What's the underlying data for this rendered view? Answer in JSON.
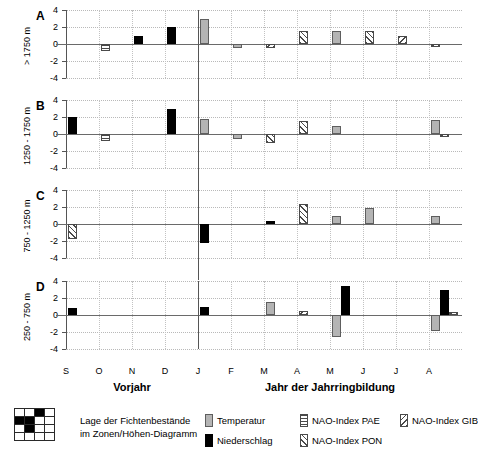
{
  "chart_data": {
    "type": "bar",
    "title": "",
    "xlabel": "",
    "ylabel": "",
    "ylim": [
      -4,
      4
    ],
    "yticks": [
      4,
      2,
      0,
      -2,
      -4
    ],
    "grid": true,
    "categories": [
      "S",
      "O",
      "N",
      "D",
      "J",
      "F",
      "M",
      "A",
      "M",
      "J",
      "J",
      "A"
    ],
    "group_labels": [
      "Vorjahr",
      "Jahr der Jahrringbildung"
    ],
    "group_split_after": "D",
    "series_keys": [
      "temperatur",
      "niederschlag",
      "pae",
      "pon",
      "gib"
    ],
    "panels": [
      {
        "letter": "A",
        "ylabel": "> 1750 m",
        "bars": [
          {
            "month": "O",
            "offset": 0,
            "value": -0.8,
            "series": "pae"
          },
          {
            "month": "N",
            "offset": 0,
            "value": 1.0,
            "series": "niederschlag"
          },
          {
            "month": "D",
            "offset": 0,
            "value": 2.0,
            "series": "niederschlag"
          },
          {
            "month": "F",
            "offset": 0,
            "value": -0.5,
            "series": "temperatur"
          },
          {
            "month": "M",
            "offset": 0,
            "value": -0.5,
            "series": "gib"
          },
          {
            "month": "A",
            "offset": 0,
            "value": 1.5,
            "series": "pon"
          },
          {
            "month": "M",
            "offset": 1,
            "value": 1.5,
            "series": "temperatur"
          },
          {
            "month": "J",
            "offset": 0,
            "value": 2.9,
            "series": "temperatur"
          },
          {
            "month": "J",
            "offset": 1,
            "value": 1.5,
            "series": "pon"
          },
          {
            "month": "J",
            "offset": 2,
            "value": 1.0,
            "series": "gib"
          },
          {
            "month": "A",
            "offset": 1,
            "value": -0.4,
            "series": "gib"
          }
        ]
      },
      {
        "letter": "B",
        "ylabel": "1250 - 1750 m",
        "bars": [
          {
            "month": "S",
            "offset": 0,
            "value": 2.0,
            "series": "niederschlag"
          },
          {
            "month": "O",
            "offset": 0,
            "value": -0.8,
            "series": "pae"
          },
          {
            "month": "D",
            "offset": 0,
            "value": 3.0,
            "series": "niederschlag"
          },
          {
            "month": "J",
            "offset": 0,
            "value": 1.0,
            "series": "niederschlag"
          },
          {
            "month": "F",
            "offset": 0,
            "value": -0.6,
            "series": "temperatur"
          },
          {
            "month": "M",
            "offset": 0,
            "value": -1.0,
            "series": "pon"
          },
          {
            "month": "A",
            "offset": 0,
            "value": 1.5,
            "series": "pon"
          },
          {
            "month": "A",
            "offset": 1,
            "value": 1.6,
            "series": "temperatur"
          },
          {
            "month": "M",
            "offset": 1,
            "value": 0.9,
            "series": "temperatur"
          },
          {
            "month": "J",
            "offset": 0,
            "value": 1.8,
            "series": "temperatur"
          },
          {
            "month": "A",
            "offset": 2,
            "value": -0.4,
            "series": "gib"
          }
        ]
      },
      {
        "letter": "C",
        "ylabel": "750 - 1250 m",
        "bars": [
          {
            "month": "S",
            "offset": 0,
            "value": -1.8,
            "series": "pon"
          },
          {
            "month": "J",
            "offset": 0,
            "value": -2.2,
            "series": "niederschlag"
          },
          {
            "month": "M",
            "offset": 0,
            "value": 0.4,
            "series": "niederschlag"
          },
          {
            "month": "A",
            "offset": 0,
            "value": 2.3,
            "series": "pon"
          },
          {
            "month": "A",
            "offset": 1,
            "value": 1.0,
            "series": "temperatur"
          },
          {
            "month": "M",
            "offset": 1,
            "value": 0.9,
            "series": "temperatur"
          },
          {
            "month": "J",
            "offset": 1,
            "value": 1.9,
            "series": "temperatur"
          }
        ]
      },
      {
        "letter": "D",
        "ylabel": "250 - 750 m",
        "bars": [
          {
            "month": "S",
            "offset": 0,
            "value": 0.8,
            "series": "niederschlag"
          },
          {
            "month": "M",
            "offset": 0,
            "value": 1.5,
            "series": "temperatur"
          },
          {
            "month": "A",
            "offset": 0,
            "value": 0.5,
            "series": "gib"
          },
          {
            "month": "A",
            "offset": 1,
            "value": -1.9,
            "series": "temperatur"
          },
          {
            "month": "A",
            "offset": 2,
            "value": 2.9,
            "series": "niederschlag"
          },
          {
            "month": "M",
            "offset": 1,
            "value": -2.6,
            "series": "temperatur"
          },
          {
            "month": "M",
            "offset": 2,
            "value": 3.4,
            "series": "niederschlag"
          },
          {
            "month": "J",
            "offset": 0,
            "value": 1.0,
            "series": "niederschlag"
          },
          {
            "month": "A",
            "offset": 3,
            "value": 0.4,
            "series": "gib"
          }
        ]
      }
    ],
    "legend": {
      "position": "bottom",
      "entries": [
        {
          "key": "map",
          "label_line1": "Lage der Fichtenbestände",
          "label_line2": "im Zonen/Höhen-Diagramm"
        },
        {
          "key": "temperatur",
          "label": "Temperatur"
        },
        {
          "key": "niederschlag",
          "label": "Niederschlag"
        },
        {
          "key": "pae",
          "label": "NAO-Index PAE"
        },
        {
          "key": "pon",
          "label": "NAO-Index PON"
        },
        {
          "key": "gib",
          "label": "NAO-Index GIB"
        }
      ],
      "map_icon": {
        "cols": 4,
        "rows": 4,
        "filled_cells": [
          [
            2,
            0
          ],
          [
            0,
            1
          ],
          [
            1,
            1
          ],
          [
            1,
            2
          ]
        ]
      }
    },
    "colors": {
      "temperatur": "#b4b4b4",
      "niederschlag": "#000000",
      "hatch": "#4a4a4a",
      "grid": "#b9b9b9",
      "axis": "#555555"
    }
  }
}
